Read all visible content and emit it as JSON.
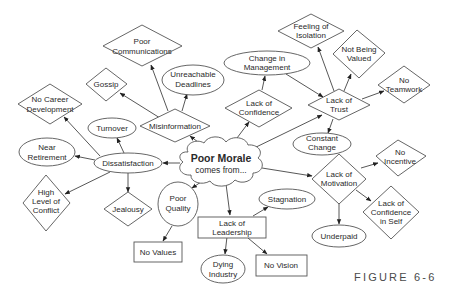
{
  "figure": {
    "caption": "FIGURE 6-6",
    "center": {
      "line1": "Poor Morale",
      "line2": "comes from..."
    }
  },
  "nodes": {
    "poor_communications": [
      "Poor",
      "Communications"
    ],
    "gossip": [
      "Gossip"
    ],
    "unreachable_deadlines": [
      "Unreachable",
      "Deadlines"
    ],
    "misinformation": [
      "Misinformation"
    ],
    "no_career_development": [
      "No Career",
      "Development"
    ],
    "turnover": [
      "Turnover"
    ],
    "near_retirement": [
      "Near",
      "Retirement"
    ],
    "dissatisfaction": [
      "Dissatisfaction"
    ],
    "high_level_of_conflict": [
      "High",
      "Level of",
      "Conflict"
    ],
    "jealousy": [
      "Jealousy"
    ],
    "poor_quality": [
      "Poor",
      "Quality"
    ],
    "no_values": [
      "No Values"
    ],
    "lack_of_leadership": [
      "Lack of",
      "Leadership"
    ],
    "dying_industry": [
      "Dying",
      "Industry"
    ],
    "no_vision": [
      "No Vision"
    ],
    "stagnation": [
      "Stagnation"
    ],
    "lack_of_motivation": [
      "Lack of",
      "Motivation"
    ],
    "no_incentive": [
      "No",
      "Incentive"
    ],
    "lack_of_confidence_in_self": [
      "Lack of",
      "Confidence",
      "in Self"
    ],
    "underpaid": [
      "Underpaid"
    ],
    "lack_of_confidence": [
      "Lack of",
      "Confidence"
    ],
    "change_in_management": [
      "Change in",
      "Management"
    ],
    "lack_of_trust": [
      "Lack of",
      "Trust"
    ],
    "feeling_of_isolation": [
      "Feeling of",
      "Isolation"
    ],
    "not_being_valued": [
      "Not Being",
      "Valued"
    ],
    "no_teamwork": [
      "No",
      "Teamwork"
    ],
    "constant_change": [
      "Constant",
      "Change"
    ]
  },
  "edges": [
    [
      "poor_morale",
      "misinformation"
    ],
    [
      "poor_morale",
      "lack_of_confidence"
    ],
    [
      "poor_morale",
      "lack_of_trust"
    ],
    [
      "poor_morale",
      "dissatisfaction"
    ],
    [
      "poor_morale",
      "poor_quality"
    ],
    [
      "poor_morale",
      "lack_of_leadership"
    ],
    [
      "poor_morale",
      "lack_of_motivation"
    ],
    [
      "misinformation",
      "poor_communications"
    ],
    [
      "misinformation",
      "gossip"
    ],
    [
      "misinformation",
      "unreachable_deadlines"
    ],
    [
      "dissatisfaction",
      "no_career_development"
    ],
    [
      "dissatisfaction",
      "turnover"
    ],
    [
      "dissatisfaction",
      "near_retirement"
    ],
    [
      "dissatisfaction",
      "high_level_of_conflict"
    ],
    [
      "dissatisfaction",
      "jealousy"
    ],
    [
      "poor_quality",
      "no_values"
    ],
    [
      "lack_of_leadership",
      "stagnation"
    ],
    [
      "lack_of_leadership",
      "dying_industry"
    ],
    [
      "lack_of_leadership",
      "no_vision"
    ],
    [
      "lack_of_motivation",
      "no_incentive"
    ],
    [
      "lack_of_motivation",
      "lack_of_confidence_in_self"
    ],
    [
      "lack_of_motivation",
      "underpaid"
    ],
    [
      "lack_of_confidence",
      "change_in_management"
    ],
    [
      "change_in_management",
      "lack_of_trust"
    ],
    [
      "lack_of_trust",
      "feeling_of_isolation"
    ],
    [
      "lack_of_trust",
      "not_being_valued"
    ],
    [
      "lack_of_trust",
      "no_teamwork"
    ],
    [
      "lack_of_trust",
      "constant_change"
    ]
  ]
}
